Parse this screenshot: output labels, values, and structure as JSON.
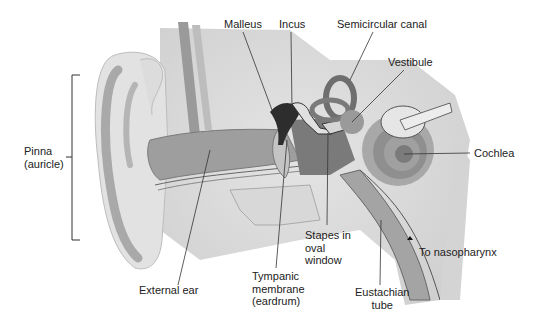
{
  "diagram": {
    "labels": {
      "malleus": "Malleus",
      "incus": "Incus",
      "semicircular_canal": "Semicircular canal",
      "vestibule": "Vestibule",
      "pinna_1": "Pinna",
      "pinna_2": "(auricle)",
      "cochlea": "Cochlea",
      "stapes_1": "Stapes in",
      "stapes_2": "oval",
      "stapes_3": "window",
      "to_nasopharynx": "To nasopharynx",
      "external_ear": "External ear",
      "tympanic_1": "Tympanic",
      "tympanic_2": "membrane",
      "tympanic_3": "(eardrum)",
      "eustachian_1": "Eustachian",
      "eustachian_2": "tube"
    },
    "colors": {
      "tissue_light": "#e6e6e6",
      "tissue_mid": "#c8c8c8",
      "tissue_dark": "#8a8a8a",
      "canal": "#9d9d9d",
      "ossicle_dark": "#2a2a2a",
      "leader_line": "#333333"
    }
  }
}
